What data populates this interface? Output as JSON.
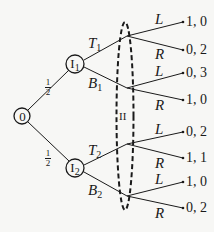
{
  "diagram": {
    "type": "game-tree",
    "root": {
      "label": "0"
    },
    "chance_probabilities": [
      {
        "num": "1",
        "den": "2"
      },
      {
        "num": "1",
        "den": "2"
      }
    ],
    "player1_nodes": [
      {
        "label": "I",
        "sub": "1",
        "actions": [
          {
            "label": "T",
            "sub": "1"
          },
          {
            "label": "B",
            "sub": "1"
          }
        ]
      },
      {
        "label": "I",
        "sub": "2",
        "actions": [
          {
            "label": "T",
            "sub": "2"
          },
          {
            "label": "B",
            "sub": "2"
          }
        ]
      }
    ],
    "information_set": {
      "label": "II"
    },
    "player2_actions": [
      "L",
      "R",
      "L",
      "R",
      "L",
      "R",
      "L",
      "R"
    ],
    "payoffs": [
      "1, 0",
      "0, 2",
      "0, 3",
      "1, 0",
      "0, 2",
      "1, 1",
      "1, 0",
      "0, 2"
    ],
    "colors": {
      "ink": "#1a1a1a",
      "background": "#f7f7f5"
    }
  }
}
